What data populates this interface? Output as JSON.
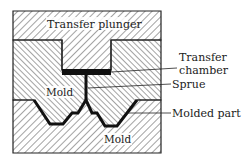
{
  "figure": {
    "type": "transfer-molding-cross-section",
    "labels": {
      "plunger": "Transfer plunger",
      "chamber_line1": "Transfer",
      "chamber_line2": "chamber",
      "sprue": "Sprue",
      "upper_mold": "Mold",
      "molded_part": "Molded part",
      "lower_mold": "Mold"
    },
    "colors": {
      "line": "#222222",
      "hatch": "#333333",
      "part": "#111111",
      "background": "#ffffff"
    }
  }
}
